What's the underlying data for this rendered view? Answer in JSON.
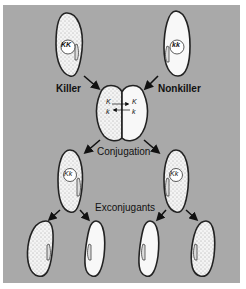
{
  "diagram": {
    "background_color": "#a9a9a9",
    "labels": {
      "killer": "Killer",
      "nonkiller": "Nonkiller",
      "conjugation": "Conjugation",
      "exconjugants": "Exconjugants"
    },
    "genotypes": {
      "killer_parent": "KK",
      "nonkiller_parent": "kk",
      "conjugant_left_top": "K",
      "conjugant_left_bottom": "k",
      "conjugant_right_top": "K",
      "conjugant_right_bottom": "k",
      "left_progeny": "Kk",
      "right_progeny": "Kk"
    },
    "cells": [
      {
        "id": "killer-parent",
        "stippled": true
      },
      {
        "id": "nonkiller-parent",
        "stippled": false
      },
      {
        "id": "conjugating-pair",
        "stippled": "left-half"
      },
      {
        "id": "left-exconjugant",
        "stippled": true
      },
      {
        "id": "right-exconjugant",
        "stippled": true
      },
      {
        "id": "progeny-1",
        "stippled": true
      },
      {
        "id": "progeny-2",
        "stippled": false
      },
      {
        "id": "progeny-3",
        "stippled": false
      },
      {
        "id": "progeny-4",
        "stippled": true
      }
    ]
  }
}
